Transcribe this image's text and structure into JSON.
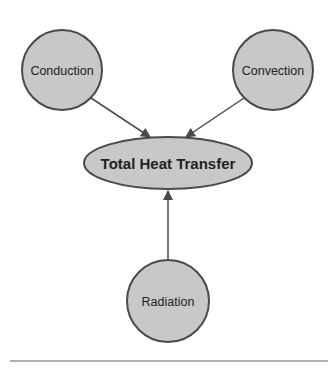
{
  "diagram": {
    "type": "influence-diagram",
    "colors": {
      "node_fill": "#c8c8c8",
      "node_stroke": "#4a4a4a",
      "edge": "#4a4a4a",
      "text": "#222222",
      "divider": "#b0b0b0"
    },
    "nodes": [
      {
        "id": "conduction",
        "label": "Conduction",
        "shape": "circle"
      },
      {
        "id": "convection",
        "label": "Convection",
        "shape": "circle"
      },
      {
        "id": "total",
        "label": "Total Heat Transfer",
        "shape": "ellipse",
        "bold": true
      },
      {
        "id": "radiation",
        "label": "Radiation",
        "shape": "circle"
      }
    ],
    "edges": [
      {
        "from": "conduction",
        "to": "total"
      },
      {
        "from": "convection",
        "to": "total"
      },
      {
        "from": "radiation",
        "to": "total"
      }
    ]
  }
}
